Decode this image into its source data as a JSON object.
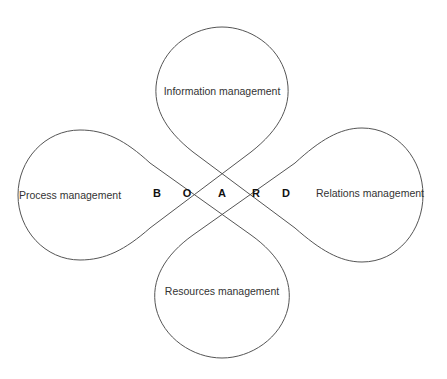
{
  "diagram": {
    "lobes": {
      "top": {
        "label": "Information management"
      },
      "left": {
        "label": "Process management"
      },
      "right": {
        "label": "Relations management"
      },
      "bottom": {
        "label": "Resources management"
      }
    },
    "center_letters": [
      "B",
      "O",
      "A",
      "R",
      "D"
    ],
    "stroke_color": "#555555",
    "background": "#ffffff"
  }
}
